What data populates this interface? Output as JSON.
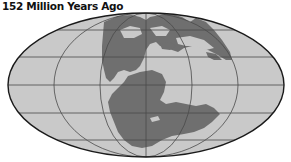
{
  "title": "152 Million Years Ago",
  "map": {
    "projection": "mollweide",
    "colors": {
      "ocean": "#c9c9c9",
      "land": "#6f6f6f",
      "gridlines": "#4a4a4a",
      "border": "#1a1a1a"
    }
  }
}
